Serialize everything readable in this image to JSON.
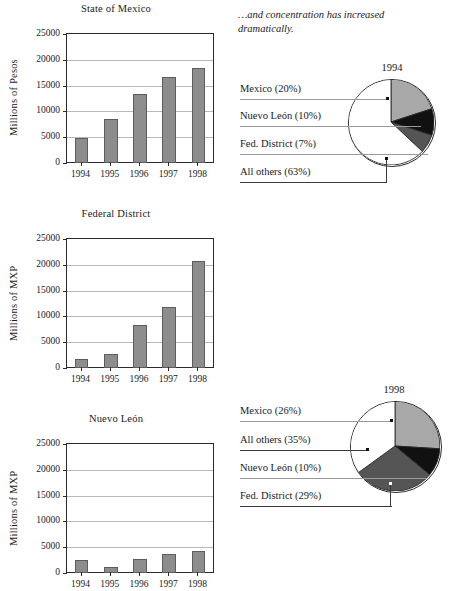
{
  "note": {
    "text": "…and concentration has increased dramatically."
  },
  "charts": [
    {
      "title": "State of Mexico",
      "ylabel": "Millions of Pesos",
      "yticks": [
        "0",
        "5000",
        "10000",
        "15000",
        "20000",
        "25000"
      ],
      "categories": [
        "1994",
        "1995",
        "1996",
        "1997",
        "1998"
      ],
      "values": [
        4800,
        8600,
        13400,
        16600,
        18500
      ]
    },
    {
      "title": "Federal District",
      "ylabel": "Millions of MXP",
      "yticks": [
        "0",
        "5000",
        "10000",
        "15000",
        "20000",
        "25000"
      ],
      "categories": [
        "1994",
        "1995",
        "1996",
        "1997",
        "1998"
      ],
      "values": [
        1700,
        2800,
        8300,
        11900,
        20700
      ]
    },
    {
      "title": "Nuevo León",
      "ylabel": "Millions of MXP",
      "yticks": [
        "0",
        "5000",
        "10000",
        "15000",
        "20000",
        "25000"
      ],
      "categories": [
        "1994",
        "1995",
        "1996",
        "1997",
        "1998"
      ],
      "values": [
        2600,
        1100,
        2800,
        3600,
        4200
      ]
    }
  ],
  "pies": [
    {
      "year": "1994",
      "labels": [
        {
          "text": "Mexico (20%)"
        },
        {
          "text": "Nuevo León (10%)"
        },
        {
          "text": "Fed. District (7%)"
        },
        {
          "text": "All others (63%)"
        }
      ],
      "slices": [
        {
          "name": "Mexico",
          "value": 20,
          "color": "#a8a8a8"
        },
        {
          "name": "Nuevo León",
          "value": 10,
          "color": "#111111"
        },
        {
          "name": "Fed. District",
          "value": 7,
          "color": "#555555"
        },
        {
          "name": "All others",
          "value": 63,
          "color": "#ffffff"
        }
      ]
    },
    {
      "year": "1998",
      "labels": [
        {
          "text": "Mexico (26%)"
        },
        {
          "text": "All others (35%)"
        },
        {
          "text": "Nuevo León (10%)"
        },
        {
          "text": "Fed. District (29%)"
        }
      ],
      "slices": [
        {
          "name": "Mexico",
          "value": 26,
          "color": "#a8a8a8"
        },
        {
          "name": "Nuevo León",
          "value": 10,
          "color": "#111111"
        },
        {
          "name": "Fed. District",
          "value": 29,
          "color": "#555555"
        },
        {
          "name": "All others",
          "value": 35,
          "color": "#ffffff"
        }
      ]
    }
  ],
  "chart_data": [
    {
      "type": "bar",
      "title": "State of Mexico",
      "xlabel": "",
      "ylabel": "Millions of Pesos",
      "categories": [
        "1994",
        "1995",
        "1996",
        "1997",
        "1998"
      ],
      "values": [
        4800,
        8600,
        13400,
        16600,
        18500
      ],
      "ylim": [
        0,
        25000
      ],
      "yticks": [
        0,
        5000,
        10000,
        15000,
        20000,
        25000
      ],
      "grid": true,
      "legend": "none",
      "bar_color": "#8d8d8d"
    },
    {
      "type": "bar",
      "title": "Federal District",
      "xlabel": "",
      "ylabel": "Millions of MXP",
      "categories": [
        "1994",
        "1995",
        "1996",
        "1997",
        "1998"
      ],
      "values": [
        1700,
        2800,
        8300,
        11900,
        20700
      ],
      "ylim": [
        0,
        25000
      ],
      "yticks": [
        0,
        5000,
        10000,
        15000,
        20000,
        25000
      ],
      "grid": true,
      "legend": "none",
      "bar_color": "#8d8d8d"
    },
    {
      "type": "bar",
      "title": "Nuevo León",
      "xlabel": "",
      "ylabel": "Millions of MXP",
      "categories": [
        "1994",
        "1995",
        "1996",
        "1997",
        "1998"
      ],
      "values": [
        2600,
        1100,
        2800,
        3600,
        4200
      ],
      "ylim": [
        0,
        25000
      ],
      "yticks": [
        0,
        5000,
        10000,
        15000,
        20000,
        25000
      ],
      "grid": true,
      "legend": "none",
      "bar_color": "#8d8d8d",
      "note": "chart is cropped at the bottom edge of the screenshot"
    },
    {
      "type": "pie",
      "title": "1994",
      "labels": [
        "Mexico",
        "Nuevo León",
        "Fed. District",
        "All others"
      ],
      "values": [
        20,
        10,
        7,
        63
      ],
      "display_labels": [
        "Mexico (20%)",
        "Nuevo León (10%)",
        "Fed. District (7%)",
        "All others (63%)"
      ],
      "colors": [
        "#a8a8a8",
        "#111111",
        "#555555",
        "#ffffff"
      ],
      "legend": "leader-lines-left"
    },
    {
      "type": "pie",
      "title": "1998",
      "labels": [
        "Mexico",
        "Nuevo León",
        "Fed. District",
        "All others"
      ],
      "values": [
        26,
        10,
        29,
        35
      ],
      "display_labels": [
        "Mexico (26%)",
        "All others (35%)",
        "Nuevo León (10%)",
        "Fed. District (29%)"
      ],
      "colors": [
        "#a8a8a8",
        "#111111",
        "#555555",
        "#ffffff"
      ],
      "legend": "leader-lines-left"
    }
  ]
}
